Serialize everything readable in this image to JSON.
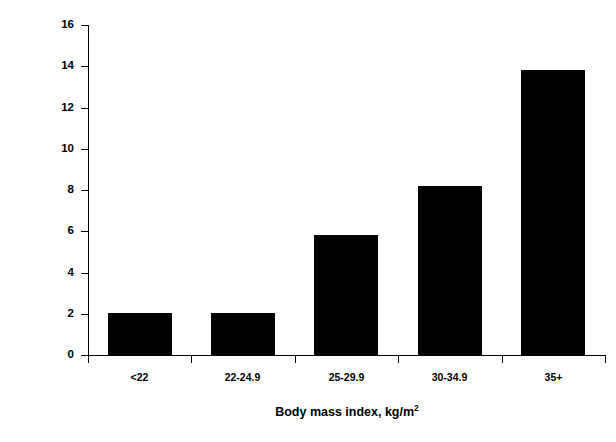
{
  "chart_data": {
    "type": "bar",
    "title": "",
    "subtitle": "",
    "categories": [
      "<22",
      "22-24.9",
      "25-29.9",
      "30-34.9",
      "35+"
    ],
    "values": [
      2.05,
      2.05,
      5.8,
      8.2,
      13.8
    ],
    "xlabel": "Body mass index, kg/m",
    "xlabel_superscript": "2",
    "ylabel": "% of Adults",
    "ylim": [
      0,
      16
    ],
    "yticks": [
      0,
      2,
      4,
      6,
      8,
      10,
      12,
      14,
      16
    ],
    "ytick_labels": [
      "0",
      "2",
      "4",
      "6",
      "8",
      "10",
      "12",
      "14",
      "16"
    ],
    "grid": false,
    "legend": false,
    "legend_position": "none",
    "bar_color": "#000000",
    "background_color": "#ffffff",
    "axis_color": "#000000"
  }
}
